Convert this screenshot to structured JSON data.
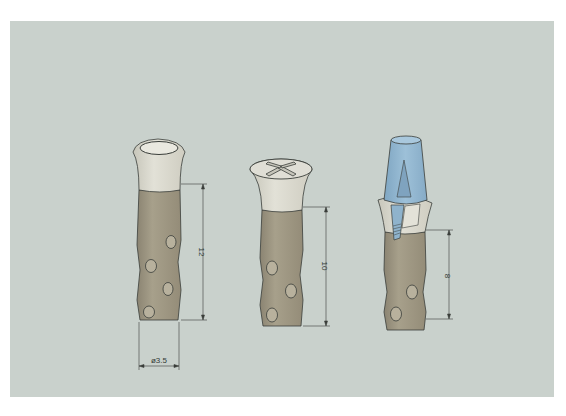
{
  "figure": {
    "background_color": "#c9d1cc",
    "implants": [
      {
        "id": "implant-1",
        "top_type": "cup",
        "length_label": "12",
        "diameter_label": "ø3.5",
        "holes": 4
      },
      {
        "id": "implant-2",
        "top_type": "cross-slotted cap",
        "length_label": "10",
        "holes": 3
      },
      {
        "id": "implant-3",
        "top_type": "abutment with blue conical post",
        "length_label": "8",
        "holes": 2
      }
    ],
    "colors": {
      "body": "#9d9581",
      "collar": "#d8d7cc",
      "post": "#8fb3cc",
      "line": "#3a3e3a"
    }
  }
}
